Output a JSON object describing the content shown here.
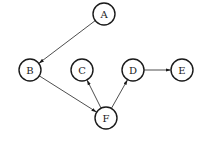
{
  "diagram": {
    "type": "directed-graph",
    "nodes": [
      {
        "id": "A",
        "label": "A",
        "x": 104,
        "y": 14
      },
      {
        "id": "B",
        "label": "B",
        "x": 30,
        "y": 70
      },
      {
        "id": "C",
        "label": "C",
        "x": 82,
        "y": 70
      },
      {
        "id": "D",
        "label": "D",
        "x": 133,
        "y": 70
      },
      {
        "id": "E",
        "label": "E",
        "x": 182,
        "y": 70
      },
      {
        "id": "F",
        "label": "F",
        "x": 106,
        "y": 118
      }
    ],
    "edges": [
      {
        "from": "A",
        "to": "B"
      },
      {
        "from": "B",
        "to": "F"
      },
      {
        "from": "F",
        "to": "C"
      },
      {
        "from": "F",
        "to": "D"
      },
      {
        "from": "D",
        "to": "E"
      }
    ],
    "node_radius": 11,
    "colors": {
      "stroke": "#1a1a1a",
      "edge": "#3a3a3a",
      "background": "#ffffff"
    }
  }
}
